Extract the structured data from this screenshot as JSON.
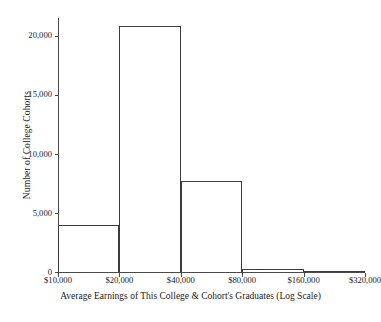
{
  "chart_data": {
    "type": "bar",
    "title": "",
    "xlabel": "Average Earnings of This College & Cohort's Graduates (Log Scale)",
    "ylabel": "Number of College Cohorts",
    "categories": [
      "$10,000–$20,000",
      "$20,000–$40,000",
      "$40,000–$80,000",
      "$80,000–$160,000",
      "$160,000–$320,000"
    ],
    "values": [
      4000,
      20800,
      7700,
      250,
      0
    ],
    "bin_edges": [
      10000,
      20000,
      40000,
      80000,
      160000,
      320000
    ],
    "xlim": [
      10000,
      320000
    ],
    "ylim": [
      0,
      21500
    ],
    "x_scale": "log2",
    "xtick_labels": [
      "$10,000",
      "$20,000",
      "$40,000",
      "$80,000",
      "$160,000",
      "$320,000"
    ],
    "xtick_values": [
      10000,
      20000,
      40000,
      80000,
      160000,
      320000
    ],
    "ytick_labels": [
      "0",
      "5,000",
      "10,000",
      "15,000",
      "20,000"
    ],
    "ytick_values": [
      0,
      5000,
      10000,
      15000,
      20000
    ],
    "grid": false,
    "legend": false,
    "bar_style": "outline",
    "bar_edge_color": "#3c3c3c",
    "bar_fill_color": "transparent",
    "axis_color": "#4a4a4a",
    "background_color": "#ffffff"
  },
  "axes": {
    "y_title": "Number of College Cohorts",
    "x_title": "Average Earnings of This College & Cohort's Graduates (Log Scale)",
    "y_ticks": [
      {
        "label": "0",
        "value": 0
      },
      {
        "label": "5,000",
        "value": 5000
      },
      {
        "label": "10,000",
        "value": 10000
      },
      {
        "label": "15,000",
        "value": 15000
      },
      {
        "label": "20,000",
        "value": 20000
      }
    ],
    "x_ticks": [
      {
        "label": "$10,000",
        "value": 10000
      },
      {
        "label": "$20,000",
        "value": 20000
      },
      {
        "label": "$40,000",
        "value": 40000
      },
      {
        "label": "$80,000",
        "value": 80000
      },
      {
        "label": "$160,000",
        "value": 160000
      },
      {
        "label": "$320,000",
        "value": 320000
      }
    ]
  }
}
